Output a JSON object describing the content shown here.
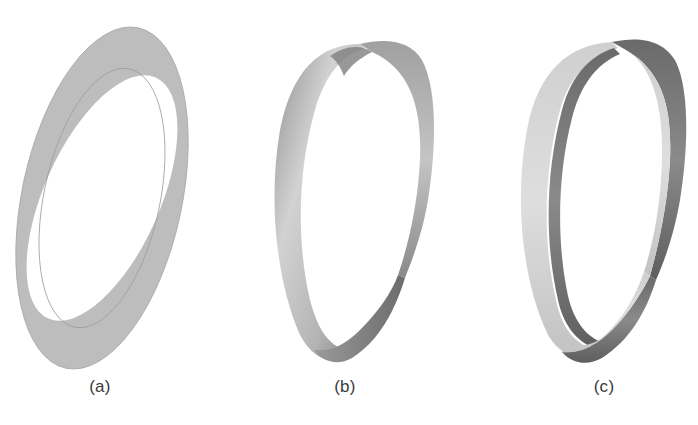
{
  "figure": {
    "panels": [
      {
        "id": "a",
        "label": "(a)",
        "description": "Flat annular ring (untwisted band)",
        "fill_color": "#bdbdbd"
      },
      {
        "id": "b",
        "label": "(b)",
        "description": "Ribbon with a half twist (Mobius band)",
        "fill_light": "#d0d0d0",
        "fill_dark": "#7a7a7a"
      },
      {
        "id": "c",
        "label": "(c)",
        "description": "Two-sided shaded twisted ribbon",
        "fill_light": "#d6d6d6",
        "fill_dark": "#6f6f6f"
      }
    ]
  }
}
